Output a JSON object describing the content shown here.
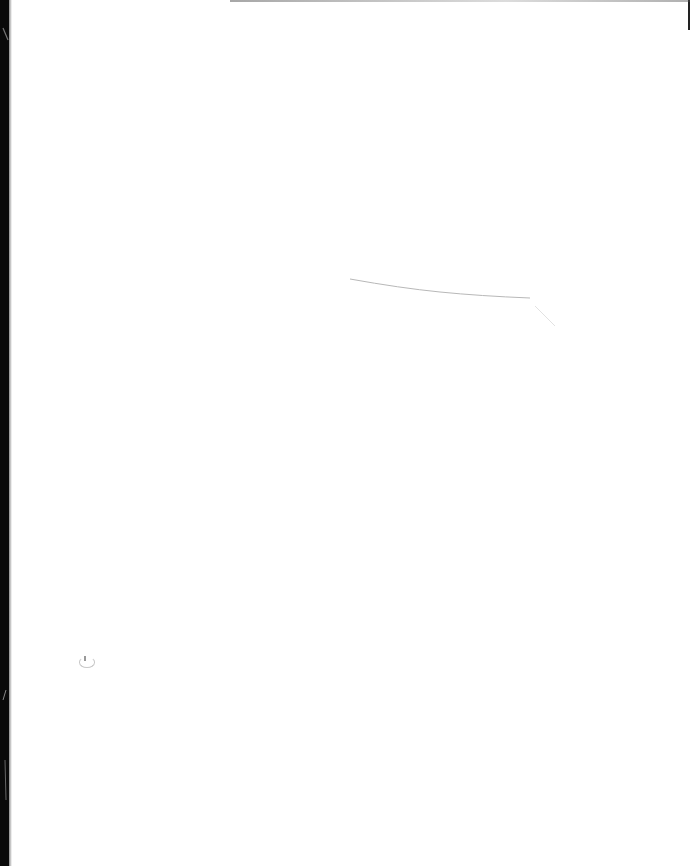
{
  "document": {
    "type": "blank scanned page",
    "text_content": "",
    "visible_marks": [
      {
        "name": "left-scan-border",
        "color": "#0a0a0a"
      },
      {
        "name": "faint-streak-artifact",
        "color": "#b0b0b0"
      },
      {
        "name": "small-smudge-artifact",
        "color": "#c8c8c8"
      }
    ]
  },
  "colors": {
    "page_background": "#ffffff",
    "scan_border": "#0a0a0a"
  }
}
